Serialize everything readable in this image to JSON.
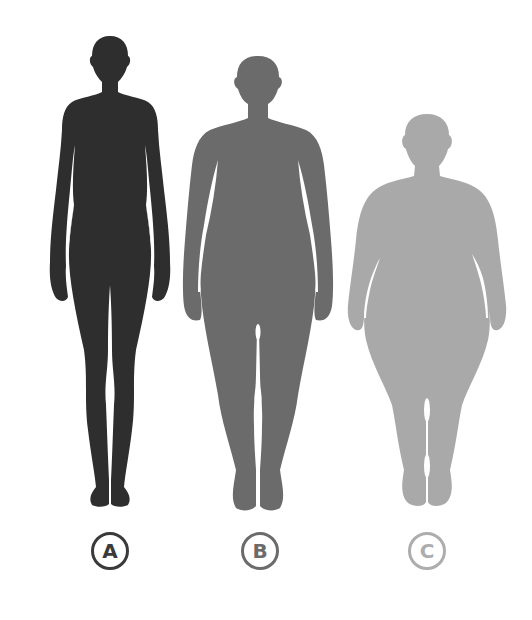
{
  "figures": [
    {
      "id": "A",
      "label": "A",
      "body_type": "slim",
      "color": "#2e2e2e",
      "label_color": "#3a3a3a"
    },
    {
      "id": "B",
      "label": "B",
      "body_type": "muscular/average",
      "color": "#6b6b6b",
      "label_color": "#6b6b6b"
    },
    {
      "id": "C",
      "label": "C",
      "body_type": "obese",
      "color": "#a9a9a9",
      "label_color": "#adadad"
    }
  ],
  "background": "#ffffff"
}
